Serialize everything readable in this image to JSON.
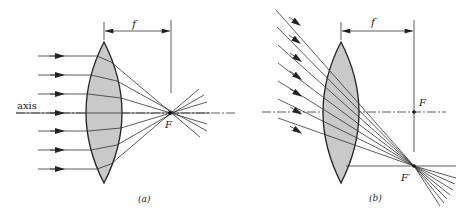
{
  "figure": {
    "panels": [
      {
        "id": "a",
        "caption": "(a)",
        "axis_label": "axis",
        "focal_label": "f",
        "focus_label": "F",
        "description": "Parallel rays along the axis converge to the focal point F on the axis"
      },
      {
        "id": "b",
        "caption": "(b)",
        "focal_label": "f",
        "focus_label": "F",
        "off_axis_focus_label": "F′",
        "description": "Oblique parallel rays converge to a point F′ in the focal plane below the axis"
      }
    ],
    "colors": {
      "lens_fill": "#c9c9c9",
      "line": "#333333",
      "background": "#ffffff"
    }
  }
}
